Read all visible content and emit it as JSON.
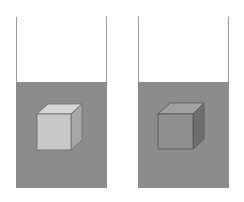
{
  "diagram": {
    "colors": {
      "background": "#ffffff",
      "beaker_wall": "#9a9a9a",
      "liquid": "#8c8c8c",
      "cube_left_front": "#c8c8c8",
      "cube_left_top": "#d6d6d6",
      "cube_left_side": "#a8a8a8",
      "cube_right_front": "#8f8f8f",
      "cube_right_top": "#a0a0a0",
      "cube_right_side": "#6e6e6e",
      "cube_edge": "#555555"
    },
    "beakers": [
      {
        "id": "left",
        "cube": "light"
      },
      {
        "id": "right",
        "cube": "dark"
      }
    ]
  }
}
